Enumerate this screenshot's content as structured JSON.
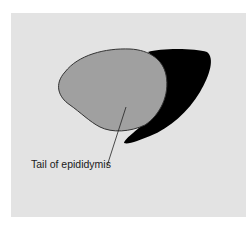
{
  "diagram": {
    "labels": {
      "tail": "Tail of epididymis"
    },
    "colors": {
      "background": "#e3e3e3",
      "testis_fill": "#a0a0a0",
      "epididymis_fill": "#000000",
      "outline": "#333333"
    }
  }
}
